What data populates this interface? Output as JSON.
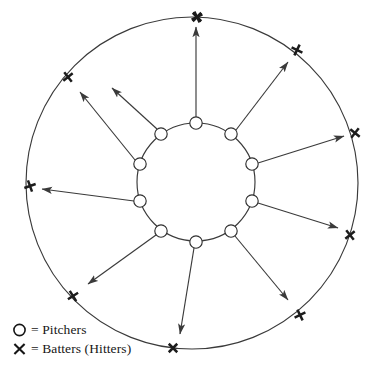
{
  "diagram": {
    "type": "radial-rotation-diagram",
    "colors": {
      "stroke": "#3a3a3a",
      "mark": "#1c1c1c",
      "node_fill": "#ffffff",
      "background": "#ffffff"
    },
    "geometry": {
      "center_x": 192,
      "center_y": 183,
      "outer_radius": 166,
      "inner_radius": 59,
      "pitcher_node_radius": 6.2,
      "batter_mark_size": 8.5,
      "count": 10
    },
    "inner_ring": {
      "name": "pitchers-ring",
      "label": "Pitchers",
      "node_count": 10
    },
    "outer_ring": {
      "name": "batters-ring",
      "label": "Batters (Hitters)",
      "node_count": 10
    },
    "pairs": [
      {
        "index": 0,
        "angle_deg": -90,
        "pitcher": {
          "x": 196,
          "y": 123
        },
        "batter": {
          "x": 197,
          "y": 17
        },
        "arrow_start": {
          "x": 196,
          "y": 118
        },
        "arrow_end": {
          "x": 196,
          "y": 27
        }
      },
      {
        "index": 1,
        "angle_deg": -54,
        "pitcher": {
          "x": 231,
          "y": 134
        },
        "batter": {
          "x": 297,
          "y": 50
        },
        "arrow_start": {
          "x": 236,
          "y": 130
        },
        "arrow_end": {
          "x": 288,
          "y": 62
        }
      },
      {
        "index": 2,
        "angle_deg": -18,
        "pitcher": {
          "x": 252,
          "y": 164
        },
        "batter": {
          "x": 355,
          "y": 133
        },
        "arrow_start": {
          "x": 258,
          "y": 163
        },
        "arrow_end": {
          "x": 344,
          "y": 136
        }
      },
      {
        "index": 3,
        "angle_deg": 18,
        "pitcher": {
          "x": 252,
          "y": 201
        },
        "batter": {
          "x": 350,
          "y": 235
        },
        "arrow_start": {
          "x": 258,
          "y": 203
        },
        "arrow_end": {
          "x": 338,
          "y": 228
        }
      },
      {
        "index": 4,
        "angle_deg": 54,
        "pitcher": {
          "x": 231,
          "y": 231
        },
        "batter": {
          "x": 300,
          "y": 315
        },
        "arrow_start": {
          "x": 235,
          "y": 236
        },
        "arrow_end": {
          "x": 288,
          "y": 300
        }
      },
      {
        "index": 5,
        "angle_deg": 90,
        "pitcher": {
          "x": 196,
          "y": 242
        },
        "batter": {
          "x": 173,
          "y": 348
        },
        "arrow_start": {
          "x": 194,
          "y": 248
        },
        "arrow_end": {
          "x": 180,
          "y": 334
        }
      },
      {
        "index": 6,
        "angle_deg": 126,
        "pitcher": {
          "x": 161,
          "y": 231
        },
        "batter": {
          "x": 73,
          "y": 296
        },
        "arrow_start": {
          "x": 156,
          "y": 235
        },
        "arrow_end": {
          "x": 88,
          "y": 284
        }
      },
      {
        "index": 7,
        "angle_deg": 162,
        "pitcher": {
          "x": 140,
          "y": 201
        },
        "batter": {
          "x": 30,
          "y": 186
        },
        "arrow_start": {
          "x": 134,
          "y": 201
        },
        "arrow_end": {
          "x": 42,
          "y": 189
        }
      },
      {
        "index": 8,
        "angle_deg": -162,
        "pitcher": {
          "x": 140,
          "y": 164
        },
        "batter": {
          "x": 68,
          "y": 77
        },
        "arrow_start": {
          "x": 135,
          "y": 160
        },
        "arrow_end": {
          "x": 80,
          "y": 92
        }
      },
      {
        "index": 9,
        "angle_deg": -126,
        "pitcher": {
          "x": 161,
          "y": 134
        },
        "batter": {
          "x": 197,
          "y": 17
        },
        "arrow_start": {
          "x": 157,
          "y": 129
        },
        "arrow_end": {
          "x": 112,
          "y": 88
        }
      }
    ]
  },
  "legend": {
    "name": "legend",
    "items": [
      {
        "glyph": "circle-icon",
        "symbol": "O",
        "equals": "=",
        "label": "Pitchers",
        "text": "= Pitchers"
      },
      {
        "glyph": "x-mark-icon",
        "symbol": "X",
        "equals": "=",
        "label": "Batters (Hitters)",
        "text": "= Batters (Hitters)"
      }
    ]
  }
}
